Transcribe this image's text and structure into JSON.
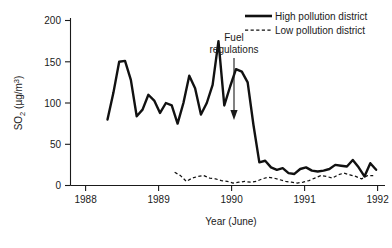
{
  "chart_data": {
    "type": "line",
    "title": "",
    "xlabel": "Year (June)",
    "ylabel": "SO2 (µg/m³)",
    "ylabel_parts": {
      "base": "SO",
      "subscript": "2",
      "units": " (µg/m",
      "superscript": "3",
      "close": ")"
    },
    "xlim": [
      1987.8,
      1992.1
    ],
    "ylim": [
      0,
      205
    ],
    "xticks": [
      1988,
      1989,
      1990,
      1991,
      1992
    ],
    "xtick_labels": [
      "1988",
      "1989",
      "1990",
      "1991",
      "1992"
    ],
    "yticks": [
      0,
      50,
      100,
      150,
      200
    ],
    "ytick_labels": [
      "0",
      "50",
      "100",
      "150",
      "200"
    ],
    "grid": false,
    "legend_position": "top-right",
    "series": [
      {
        "name": "High pollution district",
        "style": "solid",
        "color": "#111111",
        "x": [
          1988.3,
          1988.38,
          1988.46,
          1988.54,
          1988.62,
          1988.7,
          1988.78,
          1988.86,
          1988.94,
          1989.02,
          1989.1,
          1989.18,
          1989.26,
          1989.34,
          1989.42,
          1989.5,
          1989.58,
          1989.66,
          1989.74,
          1989.82,
          1989.9,
          1989.98,
          1990.06,
          1990.14,
          1990.22,
          1990.3,
          1990.38,
          1990.46,
          1990.54,
          1990.62,
          1990.7,
          1990.78,
          1990.86,
          1990.94,
          1991.02,
          1991.1,
          1991.18,
          1991.26,
          1991.34,
          1991.42,
          1991.5,
          1991.58,
          1991.66,
          1991.74,
          1991.82,
          1991.9,
          1991.98
        ],
        "y": [
          80,
          112,
          150,
          151,
          128,
          84,
          92,
          110,
          103,
          88,
          100,
          97,
          75,
          100,
          133,
          118,
          86,
          100,
          122,
          175,
          97,
          120,
          141,
          138,
          125,
          73,
          28,
          30,
          22,
          19,
          21,
          15,
          14,
          20,
          22,
          18,
          17,
          18,
          20,
          25,
          24,
          23,
          31,
          22,
          11,
          27,
          19
        ]
      },
      {
        "name": "Low pollution district",
        "style": "dashed",
        "color": "#111111",
        "x": [
          1989.22,
          1989.3,
          1989.38,
          1989.46,
          1989.54,
          1989.62,
          1989.7,
          1989.78,
          1989.86,
          1989.94,
          1990.02,
          1990.1,
          1990.18,
          1990.26,
          1990.34,
          1990.42,
          1990.5,
          1990.58,
          1990.66,
          1990.74,
          1990.82,
          1990.9,
          1990.98,
          1991.06,
          1991.14,
          1991.22,
          1991.3,
          1991.38,
          1991.46,
          1991.54,
          1991.62,
          1991.7,
          1991.78,
          1991.86,
          1991.94
        ],
        "y": [
          16,
          12,
          5,
          9,
          11,
          12,
          9,
          8,
          6,
          5,
          3,
          4,
          5,
          4,
          5,
          8,
          10,
          9,
          7,
          5,
          4,
          3,
          4,
          6,
          9,
          12,
          11,
          9,
          13,
          15,
          13,
          11,
          8,
          12,
          12
        ]
      }
    ],
    "annotations": [
      {
        "name": "fuel-regulations",
        "text_line1": "Fuel",
        "text_line2": "regulations",
        "x": 1990.08,
        "y_from": 180,
        "y_to": 82
      }
    ]
  },
  "legend": {
    "items": [
      {
        "label": "High pollution district",
        "style": "solid"
      },
      {
        "label": "Low pollution district",
        "style": "dashed"
      }
    ]
  }
}
